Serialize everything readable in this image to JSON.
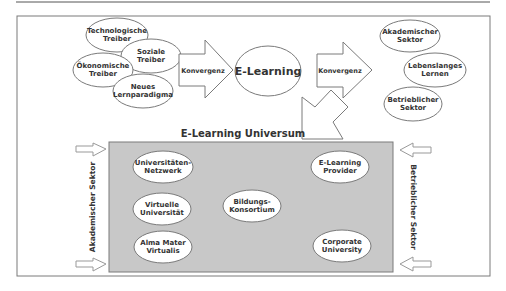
{
  "diagram": {
    "title": "E-Learning Universum",
    "center_node": "E-Learning",
    "arrow_left_label": "Konvergenz",
    "arrow_right_label": "Konvergenz",
    "drivers": [
      {
        "line1": "Technologische",
        "line2": "Treiber"
      },
      {
        "line1": "Soziale",
        "line2": "Treiber"
      },
      {
        "line1": "Ökonomische",
        "line2": "Treiber"
      },
      {
        "line1": "Neues",
        "line2": "Lernparadigma"
      }
    ],
    "outcomes": [
      {
        "line1": "Akademischer",
        "line2": "Sektor"
      },
      {
        "line1": "Lebenslanges",
        "line2": "Lernen"
      },
      {
        "line1": "Betrieblicher",
        "line2": "Sektor"
      }
    ],
    "universe_nodes": [
      {
        "line1": "Universitäten-",
        "line2": "Netzwerk"
      },
      {
        "line1": "Virtuelle",
        "line2": "Universität"
      },
      {
        "line1": "Alma Mater",
        "line2": "Virtualis"
      },
      {
        "line1": "Bildungs-",
        "line2": "Konsortium"
      },
      {
        "line1": "E-Learning",
        "line2": "Provider"
      },
      {
        "line1": "Corporate",
        "line2": "University"
      }
    ],
    "side_left_label": "Akademischer Sektor",
    "side_right_label": "Betrieblicher Sektor"
  },
  "colors": {
    "stroke": "#7a7a7a",
    "universe_fill": "#c8c8c8",
    "text": "#333333"
  }
}
